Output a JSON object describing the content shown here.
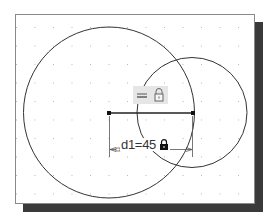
{
  "sketch": {
    "title": "2D sketch with two circles and a dimensioned line",
    "colors": {
      "background": "#ffffff",
      "frame_border": "#8a8a8a",
      "shadow": "#3a3a3a",
      "geometry": "#333333",
      "grid_dot": "#b8b8b8",
      "glyph_bg": "#e6e6e6"
    },
    "grid": {
      "spacing_px": 18.5
    },
    "geometry": {
      "large_circle": {
        "cx": 109,
        "cy": 112.5,
        "r": 85.5
      },
      "small_circle": {
        "cx": 192,
        "cy": 112.5,
        "r": 55
      },
      "line": {
        "x1": 109,
        "y1": 113,
        "x2": 193,
        "y2": 113
      }
    },
    "constraints": {
      "glyphs": [
        {
          "name": "horizontal-constraint-icon"
        },
        {
          "name": "unlocked-lock-icon"
        }
      ]
    },
    "dimension": {
      "label": "d1=45",
      "name": "d1",
      "value": "45",
      "lock_state": "locked"
    }
  }
}
